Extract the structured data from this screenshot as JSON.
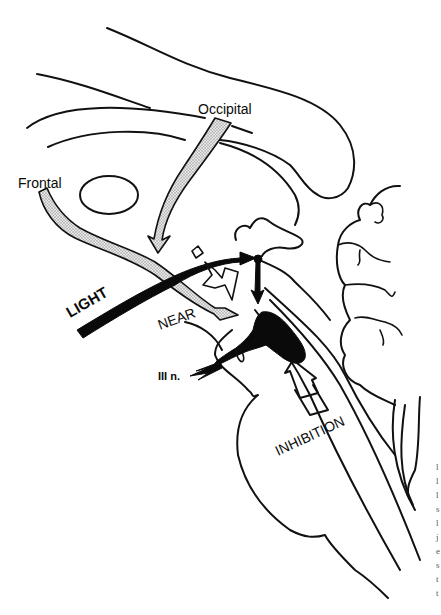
{
  "figure": {
    "type": "anatomical line drawing",
    "colors": {
      "ink": "#0a0a0a",
      "stipple_fill": "#c8c8c8",
      "background": "#ffffff",
      "margin_text": "#555555"
    }
  },
  "labels": {
    "occipital": "Occipital",
    "frontal": "Frontal",
    "light": "LIGHT",
    "near": "NEAR",
    "third_nerve": "III n.",
    "inhibition": "INHIBITION"
  },
  "pathways": [
    {
      "name": "occipital",
      "style": "stippled arrow"
    },
    {
      "name": "frontal",
      "style": "stippled arrow"
    },
    {
      "name": "light",
      "style": "solid black arrow"
    },
    {
      "name": "near",
      "style": "white outlined zig-zag arrow"
    },
    {
      "name": "inhibition",
      "style": "white outlined arrow"
    },
    {
      "name": "third_nerve",
      "style": "solid black arrow"
    }
  ],
  "margin_fragment": {
    "chars": [
      "l",
      "l",
      "l",
      "s",
      "l",
      "j",
      "e",
      "s",
      "t",
      "t"
    ]
  }
}
